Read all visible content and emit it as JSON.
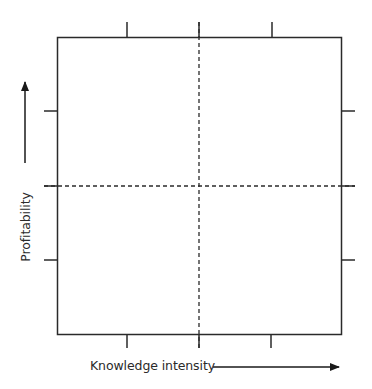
{
  "diagram": {
    "type": "quadrant-matrix",
    "x_axis": {
      "label": "Knowledge intensity",
      "direction": "increasing-right",
      "arrow": "right-arrow-icon"
    },
    "y_axis": {
      "label": "Profitability",
      "direction": "increasing-up",
      "arrow": "up-arrow-icon"
    },
    "quadrants": {
      "rows": 2,
      "cols": 2,
      "divider_style": "dashed"
    },
    "ticks": {
      "top": 3,
      "bottom": 3,
      "left": 3,
      "right": 3
    },
    "colors": {
      "stroke": "#2a2a2a",
      "background": "#ffffff"
    }
  }
}
